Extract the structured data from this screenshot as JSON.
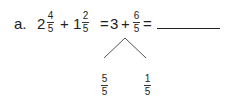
{
  "problem": {
    "label": "a.",
    "term1": {
      "whole": "2",
      "num": "4",
      "den": "5"
    },
    "plus1": "+",
    "term2": {
      "whole": "1",
      "num": "2",
      "den": "5"
    },
    "eq1": "=",
    "partial_whole": "3",
    "plus2": "+",
    "partial_frac": {
      "num": "6",
      "den": "5"
    },
    "eq2": "=",
    "answer": ""
  },
  "number_bond": {
    "left": {
      "num": "5",
      "den": "5"
    },
    "right": {
      "num": "1",
      "den": "5"
    }
  }
}
